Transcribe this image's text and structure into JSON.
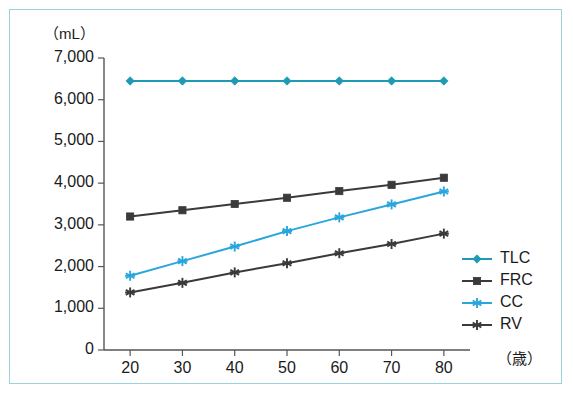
{
  "chart_data": {
    "type": "line",
    "title": "",
    "subtitle": "",
    "xlabel": "（歳）",
    "ylabel": "（mL）",
    "x": [
      20,
      30,
      40,
      50,
      60,
      70,
      80
    ],
    "x_tick_labels": [
      "20",
      "30",
      "40",
      "50",
      "60",
      "70",
      "80"
    ],
    "y_tick_labels": [
      "0",
      "1,000",
      "2,000",
      "3,000",
      "4,000",
      "5,000",
      "6,000",
      "7,000"
    ],
    "y_tick_values": [
      0,
      1000,
      2000,
      3000,
      4000,
      5000,
      6000,
      7000
    ],
    "xlim": [
      15,
      85
    ],
    "ylim": [
      0,
      7000
    ],
    "grid": false,
    "legend_position": "bottom-right",
    "series": [
      {
        "name": "TLC",
        "color": "#1f9ab4",
        "marker": "diamond",
        "values": [
          6450,
          6450,
          6450,
          6450,
          6450,
          6450,
          6450
        ]
      },
      {
        "name": "FRC",
        "color": "#3a3a3a",
        "marker": "square",
        "values": [
          3200,
          3350,
          3500,
          3650,
          3810,
          3960,
          4130
        ]
      },
      {
        "name": "CC",
        "color": "#2aa6dc",
        "marker": "asterisk",
        "values": [
          1780,
          2130,
          2480,
          2850,
          3180,
          3490,
          3800
        ]
      },
      {
        "name": "RV",
        "color": "#3a3a3a",
        "marker": "asterisk",
        "values": [
          1380,
          1610,
          1860,
          2080,
          2320,
          2540,
          2790
        ]
      }
    ]
  },
  "axes": {
    "unit_y": "（mL）",
    "unit_x": "（歳）",
    "axis_color": "#555555"
  },
  "frame": {
    "border_color": "#9cd2dd",
    "background": "#ffffff"
  }
}
